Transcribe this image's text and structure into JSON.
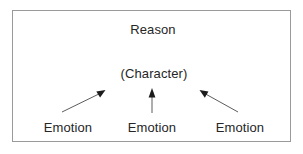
{
  "diagram": {
    "title_node": "Reason",
    "middle_node": "(Character)",
    "base_nodes": [
      {
        "label": "Emotion",
        "position": "left"
      },
      {
        "label": "Emotion",
        "position": "center"
      },
      {
        "label": "Emotion",
        "position": "right"
      }
    ],
    "arrows": [
      {
        "name": "emotion-left-to-character",
        "direction": "up-right",
        "from": [
          62,
          112
        ],
        "to": [
          104,
          91
        ]
      },
      {
        "name": "emotion-center-to-character",
        "direction": "up",
        "from": [
          152,
          113
        ],
        "to": [
          152,
          89
        ]
      },
      {
        "name": "emotion-right-to-character",
        "direction": "up-left",
        "from": [
          238,
          112
        ],
        "to": [
          201,
          91
        ]
      }
    ],
    "colors": {
      "background": "#ffffff",
      "border": "#9a9a9a",
      "text": "#262626",
      "arrow": "#4a4a4a"
    }
  }
}
